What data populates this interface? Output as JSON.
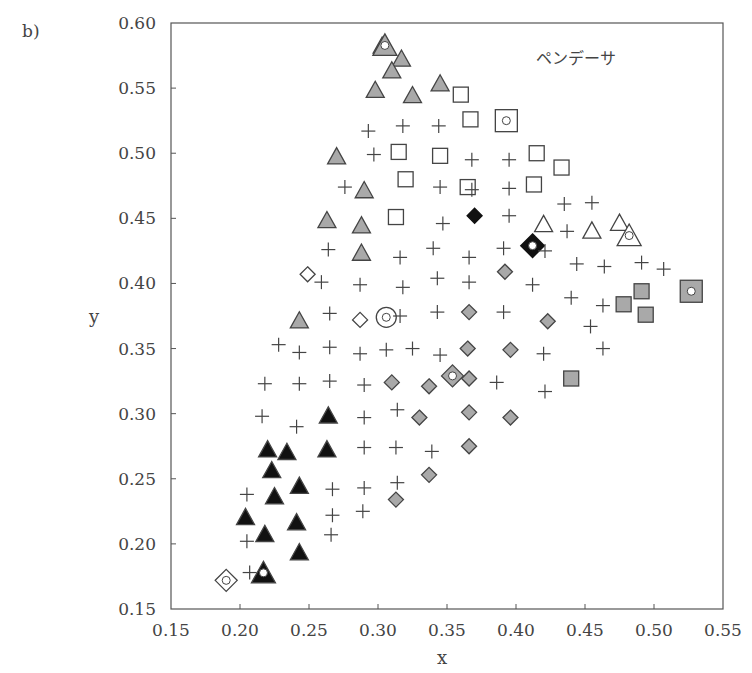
{
  "chart_data": {
    "type": "scatter",
    "panel_label": "b)",
    "title": "",
    "annotation": "ペンデーサ",
    "annotation_position": "top-right",
    "xlabel": "x",
    "ylabel": "y",
    "xlim": [
      0.15,
      0.55
    ],
    "ylim": [
      0.15,
      0.6
    ],
    "xticks": [
      "0.15",
      "0.20",
      "0.25",
      "0.30",
      "0.35",
      "0.40",
      "0.45",
      "0.50",
      "0.55"
    ],
    "yticks": [
      "0.15",
      "0.20",
      "0.25",
      "0.30",
      "0.35",
      "0.40",
      "0.45",
      "0.50",
      "0.55",
      "0.60"
    ],
    "grid": false,
    "legend": "none",
    "colors": {
      "gray_fill": "#a9a9a9",
      "black_fill": "#111111",
      "stroke": "#444444"
    },
    "series": [
      {
        "name": "gray-triangles",
        "marker": "triangle",
        "fill": "gray",
        "points": [
          [
            0.303,
            0.582
          ],
          [
            0.317,
            0.572
          ],
          [
            0.31,
            0.563
          ],
          [
            0.345,
            0.553
          ],
          [
            0.298,
            0.548
          ],
          [
            0.325,
            0.544
          ],
          [
            0.27,
            0.497
          ],
          [
            0.29,
            0.471
          ],
          [
            0.263,
            0.448
          ],
          [
            0.288,
            0.444
          ],
          [
            0.288,
            0.423
          ],
          [
            0.243,
            0.371
          ]
        ]
      },
      {
        "name": "gray-triangle-marked",
        "marker": "triangle-dot",
        "fill": "gray",
        "points": [
          [
            0.305,
            0.582
          ]
        ]
      },
      {
        "name": "open-squares",
        "marker": "square",
        "fill": "none",
        "points": [
          [
            0.36,
            0.545
          ],
          [
            0.367,
            0.526
          ],
          [
            0.315,
            0.501
          ],
          [
            0.345,
            0.498
          ],
          [
            0.415,
            0.5
          ],
          [
            0.433,
            0.489
          ],
          [
            0.32,
            0.48
          ],
          [
            0.365,
            0.474
          ],
          [
            0.413,
            0.476
          ],
          [
            0.313,
            0.451
          ]
        ]
      },
      {
        "name": "open-square-marked",
        "marker": "square-dot",
        "fill": "none",
        "points": [
          [
            0.393,
            0.525
          ]
        ]
      },
      {
        "name": "open-triangles",
        "marker": "triangle",
        "fill": "none",
        "points": [
          [
            0.42,
            0.445
          ],
          [
            0.455,
            0.44
          ],
          [
            0.475,
            0.446
          ]
        ]
      },
      {
        "name": "open-triangle-marked",
        "marker": "triangle-dot",
        "fill": "none",
        "points": [
          [
            0.482,
            0.436
          ]
        ]
      },
      {
        "name": "black-diamond",
        "marker": "diamond",
        "fill": "black",
        "points": [
          [
            0.37,
            0.452
          ]
        ]
      },
      {
        "name": "black-diamond-marked",
        "marker": "diamond-dot",
        "fill": "black",
        "points": [
          [
            0.412,
            0.429
          ]
        ]
      },
      {
        "name": "gray-diamonds",
        "marker": "diamond",
        "fill": "gray",
        "points": [
          [
            0.392,
            0.409
          ],
          [
            0.423,
            0.371
          ],
          [
            0.366,
            0.378
          ],
          [
            0.365,
            0.35
          ],
          [
            0.396,
            0.349
          ],
          [
            0.31,
            0.324
          ],
          [
            0.337,
            0.321
          ],
          [
            0.366,
            0.327
          ],
          [
            0.33,
            0.297
          ],
          [
            0.366,
            0.301
          ],
          [
            0.396,
            0.297
          ],
          [
            0.366,
            0.275
          ],
          [
            0.337,
            0.253
          ],
          [
            0.313,
            0.234
          ]
        ]
      },
      {
        "name": "gray-diamond-marked",
        "marker": "diamond-dot",
        "fill": "gray",
        "points": [
          [
            0.354,
            0.329
          ]
        ]
      },
      {
        "name": "gray-squares",
        "marker": "square",
        "fill": "gray",
        "points": [
          [
            0.478,
            0.384
          ],
          [
            0.491,
            0.394
          ],
          [
            0.494,
            0.376
          ],
          [
            0.44,
            0.327
          ]
        ]
      },
      {
        "name": "gray-square-marked",
        "marker": "square-dot",
        "fill": "gray",
        "points": [
          [
            0.527,
            0.394
          ]
        ]
      },
      {
        "name": "open-diamonds",
        "marker": "diamond",
        "fill": "none",
        "points": [
          [
            0.249,
            0.407
          ],
          [
            0.287,
            0.372
          ]
        ]
      },
      {
        "name": "open-diamond-marked",
        "marker": "diamond-dot",
        "fill": "none",
        "points": [
          [
            0.19,
            0.172
          ]
        ]
      },
      {
        "name": "open-circle-marked",
        "marker": "circle-dot",
        "fill": "none",
        "points": [
          [
            0.306,
            0.374
          ]
        ]
      },
      {
        "name": "black-triangles",
        "marker": "triangle",
        "fill": "black",
        "points": [
          [
            0.264,
            0.298
          ],
          [
            0.263,
            0.272
          ],
          [
            0.22,
            0.272
          ],
          [
            0.234,
            0.27
          ],
          [
            0.223,
            0.256
          ],
          [
            0.243,
            0.244
          ],
          [
            0.225,
            0.236
          ],
          [
            0.241,
            0.216
          ],
          [
            0.204,
            0.22
          ],
          [
            0.218,
            0.207
          ],
          [
            0.243,
            0.193
          ]
        ]
      },
      {
        "name": "black-triangle-marked",
        "marker": "triangle-dot",
        "fill": "black",
        "points": [
          [
            0.217,
            0.177
          ]
        ]
      },
      {
        "name": "crosses",
        "marker": "cross",
        "fill": "none",
        "points": [
          [
            0.293,
            0.517
          ],
          [
            0.318,
            0.521
          ],
          [
            0.344,
            0.521
          ],
          [
            0.297,
            0.499
          ],
          [
            0.368,
            0.495
          ],
          [
            0.395,
            0.495
          ],
          [
            0.276,
            0.474
          ],
          [
            0.345,
            0.474
          ],
          [
            0.368,
            0.472
          ],
          [
            0.395,
            0.473
          ],
          [
            0.435,
            0.461
          ],
          [
            0.455,
            0.462
          ],
          [
            0.347,
            0.446
          ],
          [
            0.395,
            0.452
          ],
          [
            0.437,
            0.44
          ],
          [
            0.264,
            0.426
          ],
          [
            0.316,
            0.42
          ],
          [
            0.34,
            0.427
          ],
          [
            0.366,
            0.42
          ],
          [
            0.391,
            0.427
          ],
          [
            0.421,
            0.425
          ],
          [
            0.444,
            0.415
          ],
          [
            0.464,
            0.413
          ],
          [
            0.491,
            0.416
          ],
          [
            0.507,
            0.411
          ],
          [
            0.259,
            0.401
          ],
          [
            0.287,
            0.399
          ],
          [
            0.318,
            0.397
          ],
          [
            0.343,
            0.404
          ],
          [
            0.366,
            0.401
          ],
          [
            0.412,
            0.399
          ],
          [
            0.44,
            0.389
          ],
          [
            0.463,
            0.383
          ],
          [
            0.265,
            0.377
          ],
          [
            0.316,
            0.375
          ],
          [
            0.343,
            0.378
          ],
          [
            0.391,
            0.378
          ],
          [
            0.454,
            0.367
          ],
          [
            0.463,
            0.35
          ],
          [
            0.228,
            0.353
          ],
          [
            0.243,
            0.347
          ],
          [
            0.265,
            0.351
          ],
          [
            0.287,
            0.346
          ],
          [
            0.306,
            0.349
          ],
          [
            0.325,
            0.35
          ],
          [
            0.345,
            0.345
          ],
          [
            0.42,
            0.346
          ],
          [
            0.218,
            0.323
          ],
          [
            0.243,
            0.323
          ],
          [
            0.265,
            0.325
          ],
          [
            0.29,
            0.322
          ],
          [
            0.386,
            0.324
          ],
          [
            0.421,
            0.317
          ],
          [
            0.216,
            0.298
          ],
          [
            0.241,
            0.29
          ],
          [
            0.29,
            0.297
          ],
          [
            0.314,
            0.303
          ],
          [
            0.29,
            0.274
          ],
          [
            0.313,
            0.274
          ],
          [
            0.339,
            0.271
          ],
          [
            0.205,
            0.238
          ],
          [
            0.267,
            0.242
          ],
          [
            0.29,
            0.243
          ],
          [
            0.314,
            0.247
          ],
          [
            0.205,
            0.202
          ],
          [
            0.267,
            0.222
          ],
          [
            0.289,
            0.225
          ],
          [
            0.266,
            0.207
          ],
          [
            0.207,
            0.178
          ]
        ]
      }
    ]
  }
}
